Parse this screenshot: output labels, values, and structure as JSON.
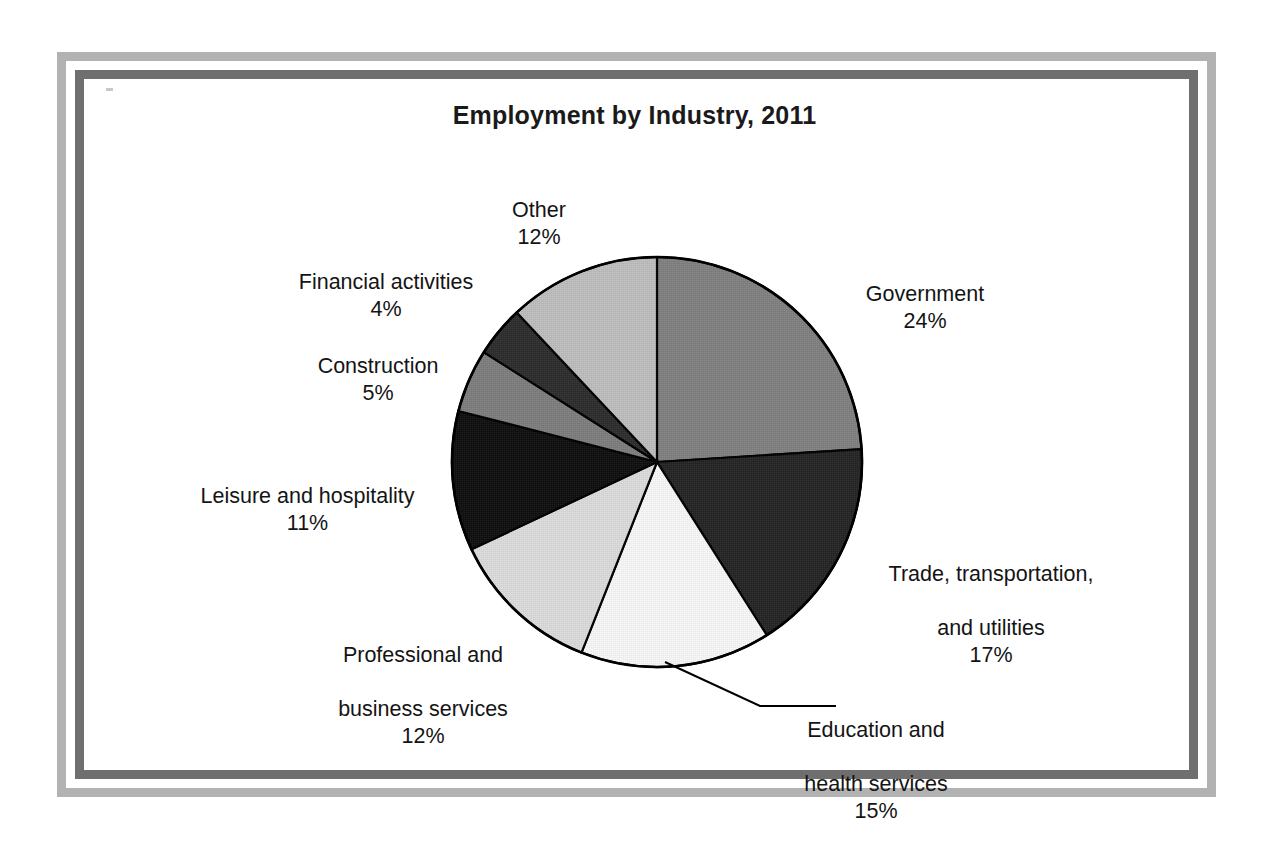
{
  "chart_data": {
    "type": "pie",
    "title": "Employment by Industry, 2011",
    "xlabel": "",
    "ylabel": "",
    "legend": "none",
    "grid": false,
    "start_angle_deg": 0,
    "direction": "clockwise",
    "units": "percent",
    "categories": [
      "Government",
      "Trade, transportation, and utilities",
      "Education and health services",
      "Professional and business services",
      "Leisure and hospitality",
      "Construction",
      "Financial activities",
      "Other"
    ],
    "values": [
      24,
      17,
      15,
      12,
      11,
      5,
      4,
      12
    ],
    "slices": [
      {
        "name": "Government",
        "label_lines": [
          "Government"
        ],
        "value": 24,
        "value_text": "24%",
        "color": "#808080",
        "label_align": "center",
        "has_leader_line": false
      },
      {
        "name": "Trade, transportation, and utilities",
        "label_lines": [
          "Trade, transportation,",
          "and utilities"
        ],
        "value": 17,
        "value_text": "17%",
        "color": "#262626",
        "label_align": "center",
        "has_leader_line": false
      },
      {
        "name": "Education and health services",
        "label_lines": [
          "Education and",
          "health services"
        ],
        "value": 15,
        "value_text": "15%",
        "color": "#f4f4f4",
        "label_align": "center",
        "has_leader_line": true
      },
      {
        "name": "Professional and business services",
        "label_lines": [
          "Professional and",
          "business services"
        ],
        "value": 12,
        "value_text": "12%",
        "color": "#d9d9d9",
        "label_align": "center",
        "has_leader_line": false
      },
      {
        "name": "Leisure and hospitality",
        "label_lines": [
          "Leisure and hospitality"
        ],
        "value": 11,
        "value_text": "11%",
        "color": "#111111",
        "label_align": "center",
        "has_leader_line": false
      },
      {
        "name": "Construction",
        "label_lines": [
          "Construction"
        ],
        "value": 5,
        "value_text": "5%",
        "color": "#7d7d7d",
        "label_align": "center",
        "has_leader_line": false
      },
      {
        "name": "Financial activities",
        "label_lines": [
          "Financial activities"
        ],
        "value": 4,
        "value_text": "4%",
        "color": "#2e2e2e",
        "label_align": "center",
        "has_leader_line": false
      },
      {
        "name": "Other",
        "label_lines": [
          "Other"
        ],
        "value": 12,
        "value_text": "12%",
        "color": "#bcbcbc",
        "label_align": "center",
        "has_leader_line": false
      }
    ]
  },
  "labels": {
    "government": "Government",
    "government_pct": "24%",
    "trade_line1": "Trade, transportation,",
    "trade_line2": "and utilities",
    "trade_pct": "17%",
    "education_line1": "Education and",
    "education_line2": "health services",
    "education_pct": "15%",
    "professional_line1": "Professional and",
    "professional_line2": "business services",
    "professional_pct": "12%",
    "leisure": "Leisure and hospitality",
    "leisure_pct": "11%",
    "construction": "Construction",
    "construction_pct": "5%",
    "financial": "Financial activities",
    "financial_pct": "4%",
    "other": "Other",
    "other_pct": "12%"
  },
  "frame": {
    "outer_color": "#b2b2b2",
    "inner_color": "#6f6f6f",
    "background": "#ffffff"
  },
  "pie_geometry": {
    "center_x": 657,
    "center_y": 462,
    "radius": 205,
    "outline_color": "#000000"
  }
}
